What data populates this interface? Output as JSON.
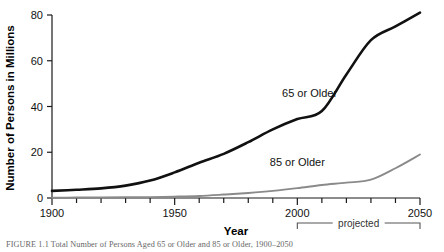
{
  "chart_data": {
    "type": "line",
    "title": "",
    "xlabel": "Year",
    "ylabel": "Number of Persons in Millions",
    "xlim": [
      1900,
      2050
    ],
    "ylim": [
      0,
      80
    ],
    "grid": false,
    "legend_position": "inline-annotation",
    "xticks": [
      1900,
      1950,
      2000,
      2050
    ],
    "xtick_labels": [
      "1900",
      "1950",
      "2000",
      "2050"
    ],
    "xminor_step": 10,
    "yticks": [
      0,
      20,
      40,
      60,
      80
    ],
    "ytick_labels": [
      "0",
      "20",
      "40",
      "60",
      "80"
    ],
    "annotations": [
      {
        "text": "projected",
        "from_x": 2000,
        "to_x": 2050,
        "kind": "bracket-below-axis"
      }
    ],
    "series": [
      {
        "name": "65 or Older",
        "color": "#111111",
        "label_x": 2005,
        "label_y": 44,
        "x": [
          1900,
          1910,
          1920,
          1930,
          1940,
          1950,
          1960,
          1970,
          1980,
          1990,
          2000,
          2010,
          2020,
          2030,
          2040,
          2050
        ],
        "values": [
          3.1,
          3.6,
          4.2,
          5.4,
          7.6,
          11.2,
          15.4,
          19.3,
          24.4,
          30.0,
          34.5,
          38.0,
          54.0,
          69.0,
          75.0,
          81.0
        ]
      },
      {
        "name": "85 or Older",
        "color": "#8a8a8a",
        "label_x": 2000,
        "label_y": 14,
        "x": [
          1900,
          1910,
          1920,
          1930,
          1940,
          1950,
          1960,
          1970,
          1980,
          1990,
          2000,
          2010,
          2020,
          2030,
          2040,
          2050
        ],
        "values": [
          0.1,
          0.2,
          0.2,
          0.3,
          0.4,
          0.6,
          0.9,
          1.5,
          2.2,
          3.1,
          4.3,
          5.7,
          6.7,
          8.0,
          13.0,
          19.0
        ]
      }
    ]
  },
  "caption": {
    "text": "FIGURE 1.1   Total Number of Persons Aged 65 or Older and 85 or Older, 1900–2050"
  }
}
